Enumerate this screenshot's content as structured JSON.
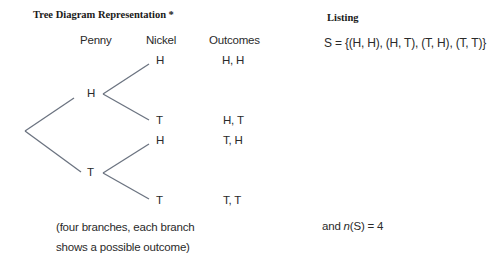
{
  "title": "Tree Diagram Representation *",
  "columns": {
    "penny": "Penny",
    "nickel": "Nickel",
    "outcomes": "Outcomes"
  },
  "tree": {
    "first_level": [
      {
        "label": "H",
        "children": [
          {
            "label": "H",
            "outcome": "H, H"
          },
          {
            "label": "T",
            "outcome": "H, T"
          }
        ]
      },
      {
        "label": "T",
        "children": [
          {
            "label": "H",
            "outcome": "T, H"
          },
          {
            "label": "T",
            "outcome": "T, T"
          }
        ]
      }
    ],
    "line_color": "#6b7380"
  },
  "caption": {
    "line1": "(four branches, each branch",
    "line2": "shows a possible outcome)"
  },
  "listing": {
    "heading": "Listing",
    "sample_space": "S = {(H, H), (H, T), (T, H), (T, T)}",
    "count_prefix": "and ",
    "count_n": "n",
    "count_rest": "(S) = 4"
  }
}
